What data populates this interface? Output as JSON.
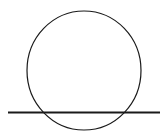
{
  "diagram": {
    "background": "#ffffff",
    "stroke_color": "#1a1a1a",
    "circle": {
      "cx": 84,
      "cy": 70.5,
      "rx": 57,
      "ry": 59.5,
      "stroke_width": 1.2
    },
    "line": {
      "x1": 8,
      "y1": 112.5,
      "x2": 160,
      "y2": 112.5,
      "stroke_width": 1.8
    }
  }
}
